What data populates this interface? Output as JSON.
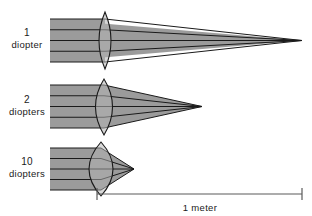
{
  "figure": {
    "background_color": "#ffffff",
    "beam_fill_color": "#9b9b9b",
    "beam_stroke_color": "#1a1a1a",
    "lens_fill_color": "#b4b4b4",
    "lens_stroke_color": "#1a1a1a",
    "ray_color": "#1a1a1a",
    "scale_color": "#5a5a5a"
  },
  "rows": [
    {
      "id": "row-1-diopter",
      "power_value": "1",
      "power_unit": "diopter",
      "label_line1": "1",
      "label_line2": "diopter",
      "label_x": 27,
      "label_y1": 36,
      "label_y2": 48,
      "beam_top": 19,
      "beam_bottom": 62,
      "beam_left": 50,
      "lens_center_x": 105,
      "lens_half_width": 12,
      "lens_top": 12,
      "lens_bottom": 69,
      "focus_x": 302,
      "focus_y": 40.5,
      "ray_count": 5
    },
    {
      "id": "row-2-diopters",
      "power_value": "2",
      "power_unit": "diopters",
      "label_line1": "2",
      "label_line2": "diopters",
      "label_x": 27,
      "label_y1": 103,
      "label_y2": 115,
      "beam_top": 85,
      "beam_bottom": 128,
      "beam_left": 50,
      "lens_center_x": 104,
      "lens_half_width": 17,
      "lens_top": 79,
      "lens_bottom": 135,
      "focus_x": 202,
      "focus_y": 106.5,
      "ray_count": 5
    },
    {
      "id": "row-10-diopters",
      "power_value": "10",
      "power_unit": "diopters",
      "label_line1": "10",
      "label_line2": "diopters",
      "label_x": 27,
      "label_y1": 165,
      "label_y2": 177,
      "beam_top": 148,
      "beam_bottom": 190,
      "beam_left": 50,
      "lens_center_x": 101,
      "lens_half_width": 24,
      "lens_top": 142,
      "lens_bottom": 196,
      "focus_x": 134,
      "focus_y": 169,
      "ray_count": 5
    }
  ],
  "scale_bar": {
    "label": "1 meter",
    "x_start": 97,
    "x_end": 302,
    "y": 194,
    "tick_height": 7,
    "label_x": 200,
    "label_y": 211
  }
}
